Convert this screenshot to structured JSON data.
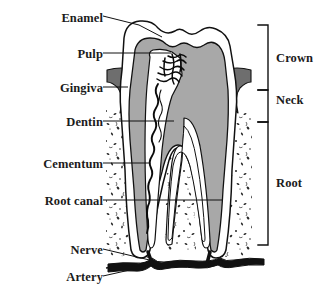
{
  "diagram": {
    "background_color": "#ffffff",
    "line_color": "#111111",
    "enamel_color": "#ffffff",
    "dentin_color": "#a8a8a8",
    "pulp_color": "#ffffff",
    "gingiva_color": "#6e6e6e",
    "bone_color": "#fbfbfb",
    "nerve_color": "#000000"
  },
  "labels_left": [
    {
      "id": "enamel",
      "text": "Enamel",
      "x": 38,
      "y": 11,
      "w": 62
    },
    {
      "id": "pulp",
      "text": "Pulp",
      "x": 56,
      "y": 47,
      "w": 44
    },
    {
      "id": "gingiva",
      "text": "Gingiva",
      "x": 35,
      "y": 81,
      "w": 65
    },
    {
      "id": "dentin",
      "text": "Dentin",
      "x": 41,
      "y": 115,
      "w": 59
    },
    {
      "id": "cementum",
      "text": "Cementum",
      "x": 16,
      "y": 157,
      "w": 84
    },
    {
      "id": "root-canal",
      "text": "Root canal",
      "x": 17,
      "y": 194,
      "w": 83
    },
    {
      "id": "nerve",
      "text": "Nerve",
      "x": 49,
      "y": 243,
      "w": 51
    },
    {
      "id": "artery",
      "text": "Artery",
      "x": 47,
      "y": 270,
      "w": 53
    }
  ],
  "labels_right": [
    {
      "id": "crown",
      "text": "Crown",
      "x": 276,
      "y": 51,
      "bracket_top": 25,
      "bracket_bottom": 90
    },
    {
      "id": "neck",
      "text": "Neck",
      "x": 276,
      "y": 93,
      "bracket_top": 90,
      "bracket_bottom": 122
    },
    {
      "id": "root",
      "text": "Root",
      "x": 276,
      "y": 176,
      "bracket_top": 122,
      "bracket_bottom": 245
    }
  ],
  "leader_lines": [
    {
      "id": "enamel-leader",
      "points": "103,16 139,25 160,36"
    },
    {
      "id": "pulp-leader",
      "points": "103,53 171,53"
    },
    {
      "id": "gingiva-leader",
      "points": "103,87 127,87"
    },
    {
      "id": "dentin-leader",
      "points": "103,121 174,121"
    },
    {
      "id": "cementum-leader",
      "points": "103,163 148,163"
    },
    {
      "id": "root-canal-leader",
      "points": "103,200 222,200"
    },
    {
      "id": "nerve-leader",
      "points": "103,249 157,261"
    },
    {
      "id": "artery-leader",
      "points": "103,276 150,264"
    }
  ],
  "brackets": {
    "axis_x": 268,
    "tick_length": 10
  }
}
